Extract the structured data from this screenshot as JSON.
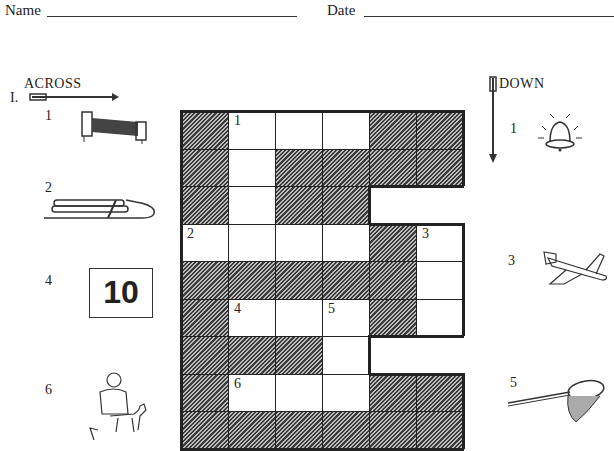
{
  "header": {
    "name_label": "Name",
    "date_label": "Date"
  },
  "across": {
    "title": "ACROSS",
    "roman": "I.",
    "clues": [
      {
        "number": "1",
        "picture": "bed-icon"
      },
      {
        "number": "2",
        "picture": "sled-icon"
      },
      {
        "number": "4",
        "picture_text": "10",
        "picture": "number-ten-box"
      },
      {
        "number": "6",
        "picture": "vet-with-dog-icon"
      }
    ]
  },
  "down": {
    "title": "DOWN",
    "clues": [
      {
        "number": "1",
        "picture": "bell-icon"
      },
      {
        "number": "3",
        "picture": "airplane-icon"
      },
      {
        "number": "5",
        "picture": "net-icon"
      }
    ]
  },
  "grid": {
    "rows": 9,
    "cols": 6,
    "cells": [
      [
        "S",
        "W",
        "W",
        "W",
        "S",
        "S"
      ],
      [
        "S",
        "W",
        "S",
        "S",
        "S",
        "S"
      ],
      [
        "S",
        "W",
        "S",
        "S",
        "B",
        "B"
      ],
      [
        "W",
        "W",
        "W",
        "W",
        "S",
        "W"
      ],
      [
        "S",
        "S",
        "S",
        "S",
        "S",
        "W"
      ],
      [
        "S",
        "W",
        "W",
        "W",
        "S",
        "W"
      ],
      [
        "S",
        "S",
        "S",
        "W",
        "B",
        "B"
      ],
      [
        "S",
        "W",
        "W",
        "W",
        "S",
        "S"
      ],
      [
        "S",
        "S",
        "S",
        "S",
        "S",
        "S"
      ]
    ],
    "numbers": [
      {
        "row": 0,
        "col": 1,
        "label": "1"
      },
      {
        "row": 3,
        "col": 0,
        "label": "2"
      },
      {
        "row": 3,
        "col": 5,
        "label": "3"
      },
      {
        "row": 5,
        "col": 1,
        "label": "4"
      },
      {
        "row": 5,
        "col": 3,
        "label": "5"
      },
      {
        "row": 7,
        "col": 1,
        "label": "6"
      }
    ]
  }
}
